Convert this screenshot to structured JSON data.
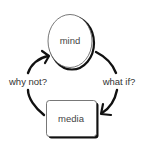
{
  "diagram": {
    "nodes": {
      "mind": {
        "label": "mind",
        "shape": "ellipse"
      },
      "media": {
        "label": "media",
        "shape": "rounded-rectangle"
      }
    },
    "edges": {
      "media_to_mind": {
        "label": "why not?",
        "from": "media",
        "to": "mind"
      },
      "mind_to_media": {
        "label": "what if?",
        "from": "mind",
        "to": "media"
      }
    },
    "colors": {
      "stroke": "#111111",
      "text": "#333333",
      "background": "#ffffff"
    }
  }
}
